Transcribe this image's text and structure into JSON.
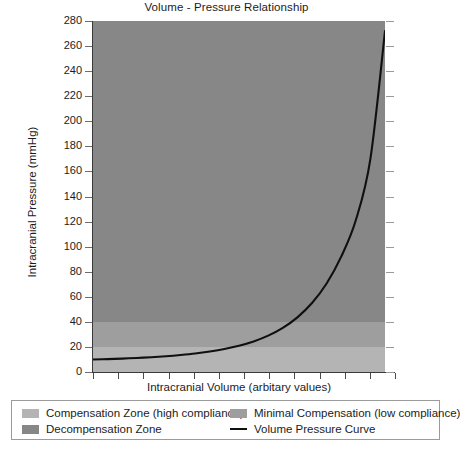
{
  "chart_data": {
    "type": "line",
    "title": "Volume - Pressure Relationship",
    "xlabel": "Intracranial Volume (arbitary values)",
    "ylabel": "Intracranial Pressure (mmHg)",
    "ylim": [
      0,
      280
    ],
    "ytick_labels": [
      "280",
      "260",
      "240",
      "220",
      "200",
      "180",
      "160",
      "140",
      "120",
      "100",
      "80",
      "60",
      "40",
      "20",
      "0"
    ],
    "ytick_values": [
      280,
      260,
      240,
      220,
      200,
      180,
      160,
      140,
      120,
      100,
      80,
      60,
      40,
      20,
      0
    ],
    "xtick_labels": [],
    "xtick_count": 12,
    "grid": false,
    "legend_position": "below-plot",
    "series": [
      {
        "name": "Volume Pressure Curve",
        "color": "#101010",
        "x": [
          0,
          5,
          10,
          15,
          20,
          25,
          30,
          35,
          40,
          45,
          50,
          55,
          60,
          65,
          70,
          75,
          80,
          85,
          90,
          95,
          100
        ],
        "values": [
          10,
          10.3,
          10.7,
          11.2,
          11.8,
          12.6,
          13.6,
          14.8,
          16.4,
          18.4,
          21,
          24.4,
          29,
          35.2,
          43.6,
          55,
          70.6,
          92,
          121,
          170,
          272
        ]
      }
    ],
    "zones": [
      {
        "name": "Compensation Zone (high compliance)",
        "label": "Compensation Zone (high compliance)",
        "color": "#b4b4b4",
        "y_range": [
          0,
          20
        ]
      },
      {
        "name": "Minimal Compensation (low compliance)",
        "label": "Minimal Compensation (low compliance)",
        "color": "#9e9e9e",
        "y_range": [
          20,
          40
        ]
      },
      {
        "name": "Decompensation Zone",
        "label": "Decompensation Zone",
        "color": "#878787",
        "y_range": [
          40,
          280
        ]
      }
    ],
    "legend": [
      {
        "label": "Compensation Zone (high compliance)",
        "swatch": "#b4b4b4",
        "kind": "swatch"
      },
      {
        "label": "Decompensation Zone",
        "swatch": "#878787",
        "kind": "swatch"
      },
      {
        "label": "Minimal Compensation (low compliance)",
        "swatch": "#9e9e9e",
        "kind": "swatch"
      },
      {
        "label": "Volume Pressure Curve",
        "swatch": "#101010",
        "kind": "line"
      }
    ]
  }
}
